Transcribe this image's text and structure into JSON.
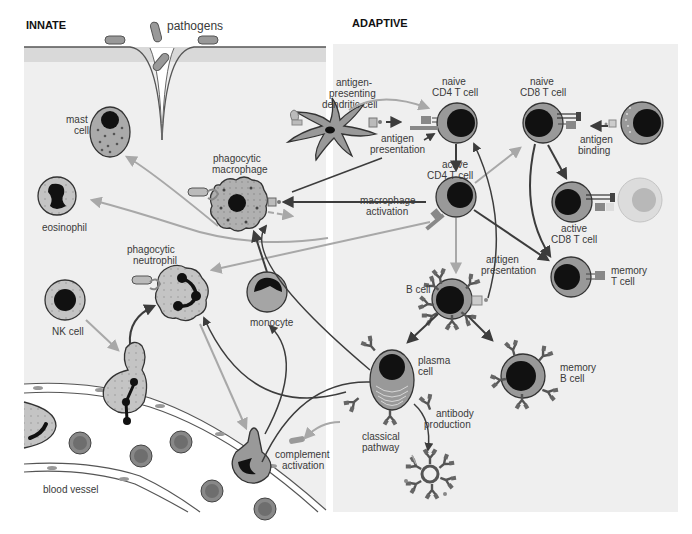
{
  "sections": {
    "innate": "INNATE",
    "adaptive": "ADAPTIVE"
  },
  "colors": {
    "panel": "#efefef",
    "band": "#d9d9d9",
    "cell_fill": "#a9a9a9",
    "cell_light": "#c8c8c8",
    "nucleus": "#1a1a1a",
    "dark_arrow": "#3c3c3c",
    "light_arrow": "#a8a8a8",
    "vessel_bg": "#ffffff"
  },
  "labels": {
    "pathogens": "pathogens",
    "mast_cell": [
      "mast",
      "cell"
    ],
    "eosinophil": "eosinophil",
    "phagocytic_macrophage": [
      "phagocytic",
      "macrophage"
    ],
    "phagocytic_neutrophil": [
      "phagocytic",
      "neutrophil"
    ],
    "nk_cell": "NK cell",
    "monocyte": "monocyte",
    "blood_vessel": "blood vessel",
    "complement_activation": [
      "complement",
      "activation"
    ],
    "dendritic_cell": [
      "antigen-",
      "presenting",
      "dendritic cell"
    ],
    "antigen_presentation_1": [
      "antigen",
      "presentation"
    ],
    "naive_cd4": [
      "naive",
      "CD4 T cell"
    ],
    "naive_cd8": [
      "naive",
      "CD8 T cell"
    ],
    "antigen_binding": [
      "antigen",
      "binding"
    ],
    "active_cd4": [
      "active",
      "CD4 T cell"
    ],
    "macrophage_activation": [
      "macrophage",
      "activation"
    ],
    "active_cd8": [
      "active",
      "CD8 T cell"
    ],
    "antigen_presentation_2": [
      "antigen",
      "presentation"
    ],
    "memory_t": [
      "memory",
      "T cell"
    ],
    "b_cell": "B cell",
    "plasma_cell": [
      "plasma",
      "cell"
    ],
    "memory_b": [
      "memory",
      "B cell"
    ],
    "antibody_production": [
      "antibody",
      "production"
    ],
    "classical_pathway": [
      "classical",
      "pathway"
    ]
  }
}
